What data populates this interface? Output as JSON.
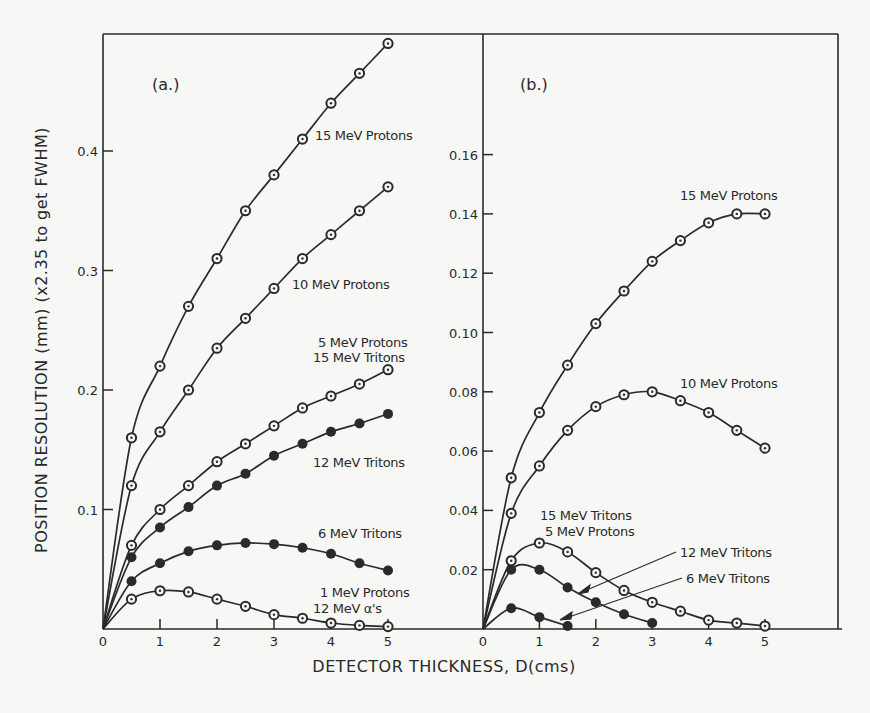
{
  "figure": {
    "xlabel": "DETECTOR THICKNESS, D(cms)",
    "ylabel": "POSITION RESOLUTION (mm) (x2.35 to get FWHM)",
    "colors": {
      "ink": "#2a2a2a",
      "background": "#f7f7f5"
    }
  },
  "chart_data": [
    {
      "panel": "(a.)",
      "type": "line",
      "xlabel": "DETECTOR THICKNESS, D(cms)",
      "ylabel": "POSITION RESOLUTION (mm) (x2.35 to get FWHM)",
      "xlim": [
        0,
        5
      ],
      "ylim": [
        0,
        0.5
      ],
      "xticks": [
        0,
        1,
        2,
        3,
        4,
        5
      ],
      "yticks": [
        0.1,
        0.2,
        0.3,
        0.4
      ],
      "ytick_labels": [
        "0.1",
        "0.2",
        "0.3",
        "0.4"
      ],
      "x": [
        0.5,
        1,
        1.5,
        2,
        2.5,
        3,
        3.5,
        4,
        4.5,
        5
      ],
      "series": [
        {
          "name": "15 MeV Protons",
          "marker": "open",
          "values": [
            0.16,
            0.22,
            0.27,
            0.31,
            0.35,
            0.38,
            0.41,
            0.44,
            0.465,
            0.49
          ]
        },
        {
          "name": "10 MeV Protons",
          "marker": "open",
          "values": [
            0.12,
            0.165,
            0.2,
            0.235,
            0.26,
            0.285,
            0.31,
            0.33,
            0.35,
            0.37
          ]
        },
        {
          "name": "5 MeV Protons / 15 MeV Tritons",
          "marker": "open",
          "values": [
            0.07,
            0.1,
            0.12,
            0.14,
            0.155,
            0.17,
            0.185,
            0.195,
            0.205,
            0.217
          ]
        },
        {
          "name": "12 MeV Tritons",
          "marker": "filled",
          "values": [
            0.06,
            0.085,
            0.102,
            0.12,
            0.13,
            0.145,
            0.155,
            0.165,
            0.172,
            0.18
          ]
        },
        {
          "name": "6 MeV Tritons",
          "marker": "filled",
          "values": [
            0.04,
            0.055,
            0.065,
            0.07,
            0.072,
            0.071,
            0.068,
            0.063,
            0.055,
            0.049
          ]
        },
        {
          "name": "1 MeV Protons / 12 MeV α's",
          "marker": "open",
          "values": [
            0.025,
            0.032,
            0.031,
            0.025,
            0.019,
            0.012,
            0.009,
            0.005,
            0.003,
            0.002
          ]
        }
      ],
      "annotations": [
        "15 MeV Protons",
        "10 MeV Protons",
        "5 MeV Protons",
        "15 MeV Tritons",
        "12 MeV Tritons",
        "6 MeV Tritons",
        "1 MeV Protons",
        "12 MeV α's"
      ]
    },
    {
      "panel": "(b.)",
      "type": "line",
      "xlabel": "DETECTOR THICKNESS, D(cms)",
      "xlim": [
        0,
        5
      ],
      "ylim": [
        0,
        0.18
      ],
      "xticks": [
        0,
        1,
        2,
        3,
        4,
        5
      ],
      "yticks": [
        0.02,
        0.04,
        0.06,
        0.08,
        0.1,
        0.12,
        0.14,
        0.16
      ],
      "ytick_labels": [
        "0.02",
        "0.04",
        "0.06",
        "0.08",
        "0.10",
        "0.12",
        "0.14",
        "0.16"
      ],
      "series": [
        {
          "name": "15 MeV Protons",
          "marker": "open",
          "x": [
            0.5,
            1,
            1.5,
            2,
            2.5,
            3,
            3.5,
            4,
            4.5,
            5
          ],
          "values": [
            0.051,
            0.073,
            0.089,
            0.103,
            0.114,
            0.124,
            0.131,
            0.137,
            0.14,
            0.14
          ]
        },
        {
          "name": "10 MeV Protons",
          "marker": "open",
          "x": [
            0.5,
            1,
            1.5,
            2,
            2.5,
            3,
            3.5,
            4,
            4.5,
            5
          ],
          "values": [
            0.039,
            0.055,
            0.067,
            0.075,
            0.079,
            0.08,
            0.077,
            0.073,
            0.067,
            0.061
          ]
        },
        {
          "name": "15 MeV Tritons / 5 MeV Protons",
          "marker": "open",
          "x": [
            0.5,
            1,
            1.5,
            2,
            2.5,
            3,
            3.5,
            4,
            4.5,
            5
          ],
          "values": [
            0.023,
            0.029,
            0.026,
            0.019,
            0.013,
            0.009,
            0.006,
            0.003,
            0.002,
            0.001
          ]
        },
        {
          "name": "12 MeV Tritons",
          "marker": "filled",
          "x": [
            0.5,
            1,
            1.5,
            2,
            2.5,
            3
          ],
          "values": [
            0.02,
            0.02,
            0.014,
            0.009,
            0.005,
            0.002
          ]
        },
        {
          "name": "6 MeV Tritons",
          "marker": "filled",
          "x": [
            0.5,
            1,
            1.5
          ],
          "values": [
            0.007,
            0.004,
            0.001
          ]
        }
      ],
      "annotations": [
        "15 MeV Protons",
        "10 MeV Protons",
        "15 MeV Tritons",
        "5 MeV Protons",
        "12 MeV Tritons",
        "6 MeV Tritons"
      ]
    }
  ],
  "panel_a": {
    "tag": "(a.)",
    "labels": {
      "p15": "15 MeV Protons",
      "p10": "10 MeV Protons",
      "p5": "5 MeV Protons",
      "t15": "15 MeV Tritons",
      "t12": "12 MeV Tritons",
      "t6": "6 MeV Tritons",
      "p1": "1 MeV Protons",
      "alpha12": "12 MeV α's"
    },
    "yticks": [
      "0.1",
      "0.2",
      "0.3",
      "0.4"
    ],
    "xticks": [
      "0",
      "1",
      "2",
      "3",
      "4",
      "5"
    ]
  },
  "panel_b": {
    "tag": "(b.)",
    "labels": {
      "p15": "15 MeV Protons",
      "p10": "10 MeV Protons",
      "t15": "15 MeV Tritons",
      "p5": "5 MeV Protons",
      "t12": "12 MeV Tritons",
      "t6": "6 MeV Tritons"
    },
    "yticks": [
      "0.02",
      "0.04",
      "0.06",
      "0.08",
      "0.10",
      "0.12",
      "0.14",
      "0.16"
    ],
    "xticks": [
      "0",
      "1",
      "2",
      "3",
      "4",
      "5"
    ]
  }
}
